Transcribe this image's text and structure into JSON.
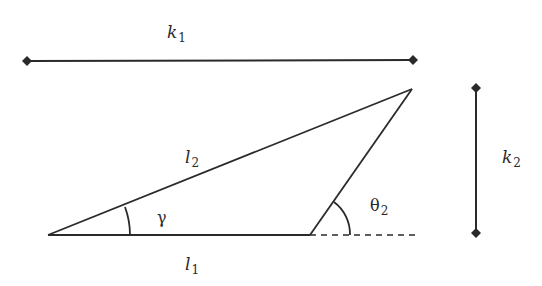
{
  "diagram": {
    "title": "",
    "stroke_color": "#2a2a2a",
    "background": "#ffffff",
    "labels": {
      "k1": {
        "symbol": "k",
        "subscript": "1"
      },
      "k2": {
        "symbol": "k",
        "subscript": "2"
      },
      "l1": {
        "symbol": "l",
        "subscript": "1"
      },
      "l2": {
        "symbol": "l",
        "subscript": "2"
      },
      "gamma": {
        "symbol": "γ",
        "subscript": ""
      },
      "theta2": {
        "symbol": "θ",
        "subscript": "2"
      }
    },
    "elements": [
      {
        "id": "k1-dimension",
        "type": "horizontal dimension line with diamond ends",
        "label": "k1"
      },
      {
        "id": "k2-dimension",
        "type": "vertical dimension line with diamond ends",
        "label": "k2"
      },
      {
        "id": "side-l1",
        "type": "triangle base",
        "label": "l1"
      },
      {
        "id": "side-l2",
        "type": "triangle hypotenuse",
        "label": "l2"
      },
      {
        "id": "side-3",
        "type": "triangle right side",
        "label": ""
      },
      {
        "id": "extension",
        "type": "dashed base extension",
        "label": ""
      },
      {
        "id": "angle-gamma",
        "type": "angle arc at left vertex",
        "label": "gamma"
      },
      {
        "id": "angle-theta2",
        "type": "angle arc at base-right vertex",
        "label": "theta2"
      }
    ]
  }
}
